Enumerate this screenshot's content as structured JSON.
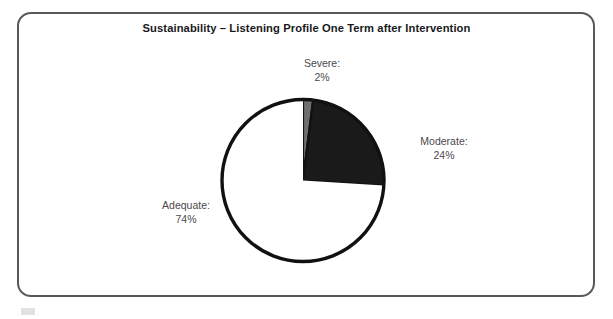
{
  "figure": {
    "title": "Sustainability – Listening Profile One Term after Intervention",
    "frame_color": "#58595b",
    "background": "#ffffff"
  },
  "chart_data": {
    "type": "pie",
    "title": "Sustainability – Listening Profile One Term after Intervention",
    "categories": [
      "Severe",
      "Moderate",
      "Adequate"
    ],
    "values": [
      2,
      24,
      74
    ],
    "value_unit": "%",
    "labels": [
      "Severe:",
      "Moderate:",
      "Adequate:"
    ],
    "value_labels": [
      "2%",
      "24%",
      "74%"
    ],
    "colors": [
      "#6e6f71",
      "#1a1a1a",
      "#ffffff"
    ],
    "slice_outline_color": "#111111",
    "start_angle_deg": 0,
    "direction": "clockwise",
    "legend": "none",
    "labels_position": "outside-callout",
    "xlabel": "",
    "ylabel": "",
    "grid": false,
    "slices": [
      {
        "name": "Severe",
        "label": "Severe:",
        "value": 2,
        "value_label": "2%",
        "color": "#6e6f71"
      },
      {
        "name": "Moderate",
        "label": "Moderate:",
        "value": 24,
        "value_label": "24%",
        "color": "#1a1a1a"
      },
      {
        "name": "Adequate",
        "label": "Adequate:",
        "value": 74,
        "value_label": "74%",
        "color": "#ffffff"
      }
    ]
  }
}
